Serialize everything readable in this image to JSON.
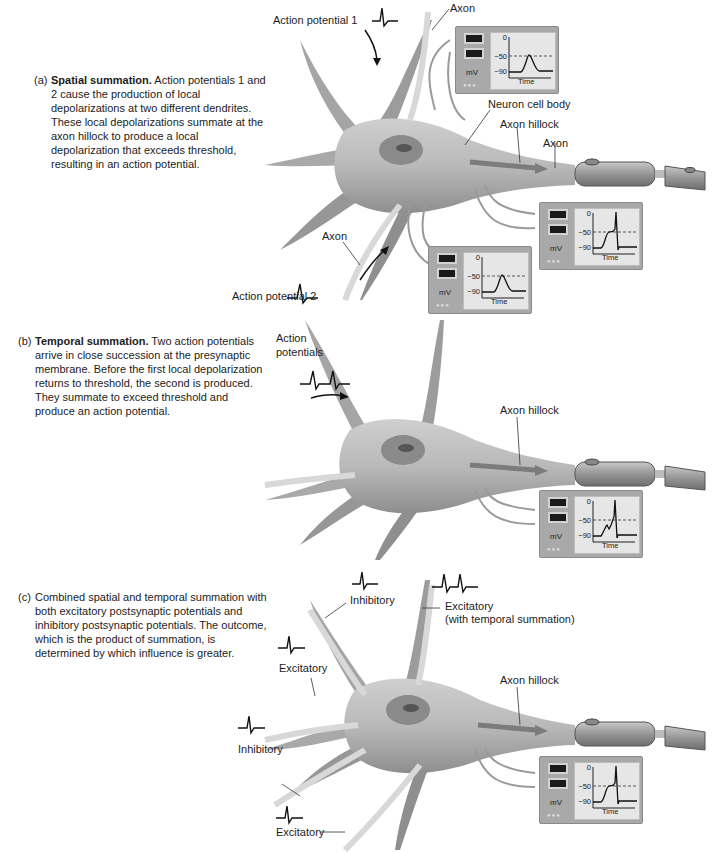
{
  "panels": [
    {
      "id": "a",
      "tag": "(a)",
      "title": "Spatial summation.",
      "text": "Action potentials 1 and 2 cause the production of local depolarizations at two different dendrites. These local depolarizations summate at the axon hillock to produce a local depolarization that exceeds threshold, resulting in an action potential.",
      "labels": {
        "ap1": "Action potential 1",
        "axon_top": "Axon",
        "cell_body": "Neuron cell body",
        "hillock": "Axon hillock",
        "axon_right": "Axon",
        "axon_bottom": "Axon",
        "ap2": "Action potential 2"
      },
      "scopes": [
        {
          "name": "dendrite-1-recording",
          "trace": "local-depolarization"
        },
        {
          "name": "axon-hillock-recording",
          "trace": "summed-action-potential"
        },
        {
          "name": "dendrite-2-recording",
          "trace": "local-depolarization"
        }
      ]
    },
    {
      "id": "b",
      "tag": "(b)",
      "title": "Temporal summation.",
      "text": "Two action potentials arrive in close succession at the presynaptic membrane. Before the first local depolarization returns to threshold, the second is produced. They summate to exceed threshold and produce an action potential.",
      "labels": {
        "aps_line1": "Action",
        "aps_line2": "potentials",
        "hillock": "Axon hillock"
      },
      "scopes": [
        {
          "name": "axon-hillock-recording",
          "trace": "temporal-summation-action-potential"
        }
      ]
    },
    {
      "id": "c",
      "tag": "(c)",
      "title": "",
      "text": "Combined spatial and temporal summation with both excitatory postsynaptic potentials and inhibitory postsynaptic potentials. The outcome, which is the product of summation, is determined by which influence is greater.",
      "labels": {
        "inhibitory_top": "Inhibitory",
        "excitatory_temporal_1": "Excitatory",
        "excitatory_temporal_2": "(with temporal summation)",
        "excitatory_left": "Excitatory",
        "inhibitory_left": "Inhibitory",
        "excitatory_bottom": "Excitatory",
        "hillock": "Axon hillock"
      },
      "scopes": [
        {
          "name": "axon-hillock-recording",
          "trace": "combined-action-potential"
        }
      ]
    }
  ],
  "scope": {
    "unit": "mV",
    "ticks": [
      "0",
      "−50",
      "−90"
    ],
    "xlabel": "Time",
    "dots": "●●●"
  }
}
